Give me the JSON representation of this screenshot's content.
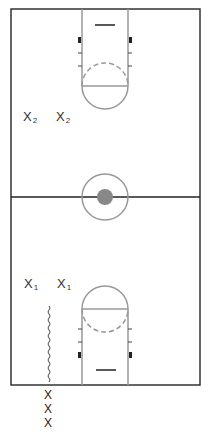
{
  "diagram": {
    "title": "",
    "court": {
      "line_color": "#333333",
      "lane_color": "#999999",
      "center_fill": "#888888"
    },
    "players": {
      "team2": [
        {
          "label": "X",
          "sub": "2",
          "x": 23,
          "y": 110
        },
        {
          "label": "X",
          "sub": "2",
          "x": 56,
          "y": 110
        }
      ],
      "team1": [
        {
          "label": "X",
          "sub": "1",
          "x": 24,
          "y": 277
        },
        {
          "label": "X",
          "sub": "1",
          "x": 57,
          "y": 277
        }
      ],
      "line_outside": [
        {
          "label": "X",
          "x": 44,
          "y": 389
        },
        {
          "label": "X",
          "x": 44,
          "y": 403
        },
        {
          "label": "X",
          "x": 44,
          "y": 417
        }
      ]
    },
    "annotations": {
      "dribble_path": "wavy line"
    }
  }
}
